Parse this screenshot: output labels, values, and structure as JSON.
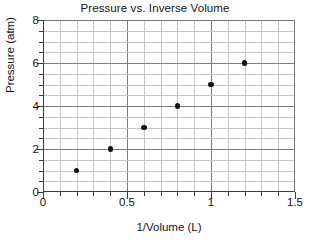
{
  "chart_data": {
    "type": "scatter",
    "title": "Pressure vs. Inverse Volume",
    "xlabel": "1/Volume  (L)",
    "ylabel": "Pressure  (atm)",
    "xlim": [
      0,
      1.5
    ],
    "ylim": [
      0,
      8
    ],
    "grid": true,
    "legend": null,
    "x": [
      0.2,
      0.4,
      0.6,
      0.8,
      1.0,
      1.2
    ],
    "y": [
      1,
      2,
      3,
      4,
      5,
      6
    ],
    "points": [
      {
        "x": 0.2,
        "y": 1
      },
      {
        "x": 0.4,
        "y": 2
      },
      {
        "x": 0.6,
        "y": 3
      },
      {
        "x": 0.8,
        "y": 4
      },
      {
        "x": 1.0,
        "y": 5
      },
      {
        "x": 1.2,
        "y": 6
      }
    ],
    "xticks": [
      {
        "value": 0,
        "label": "0"
      },
      {
        "value": 0.5,
        "label": "0.5"
      },
      {
        "value": 1.0,
        "label": "1"
      },
      {
        "value": 1.5,
        "label": "1.5"
      }
    ],
    "yticks": [
      {
        "value": 0,
        "label": "0"
      },
      {
        "value": 2,
        "label": "2"
      },
      {
        "value": 4,
        "label": "4"
      },
      {
        "value": 6,
        "label": "6"
      },
      {
        "value": 8,
        "label": "8"
      }
    ],
    "x_minor_step": 0.1,
    "y_minor_step": 0.5,
    "marker_color": "#111111",
    "grid_minor_color": "#c8c8c8",
    "grid_major_color": "#7d7d7d",
    "axis_color": "#3c3c3c",
    "background": "#ffffff"
  }
}
